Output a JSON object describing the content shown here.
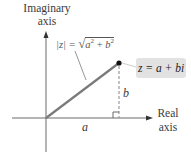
{
  "diagram": {
    "vertical_axis_label": [
      "Imaginary",
      "axis"
    ],
    "horizontal_axis_label": [
      "Real",
      "axis"
    ],
    "point_label": "z = a + bi",
    "modulus_label": {
      "lhs": "|z| = ",
      "radical": "√",
      "a": "a",
      "exp_a": "2",
      "plus": " + ",
      "b": "b",
      "exp_b": "2"
    },
    "segment_labels": {
      "horizontal": "a",
      "vertical": "b"
    },
    "colors": {
      "axis": "#6a6a6a",
      "vector": "#7a7a7a",
      "dashed": "#9a9a9a",
      "point": "#111111",
      "label_box": "#e2e2e2"
    }
  }
}
